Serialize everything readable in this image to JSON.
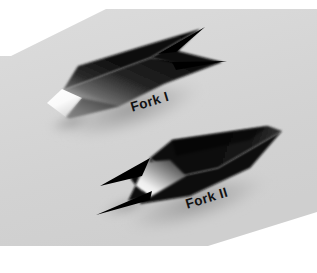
{
  "figure": {
    "kind": "grayscale-photograph",
    "canvas": {
      "width": 317,
      "height": 273
    }
  },
  "labels": {
    "fork_1": "Fork I",
    "fork_2": "Fork II",
    "rotation_deg": -17,
    "color": "#121212"
  },
  "colors": {
    "page_background": "#ffffff",
    "backdrop_light": "#e2e2e2",
    "backdrop_mid": "#d6d6d6",
    "backdrop_dark": "#c9c9c9",
    "object_black": "#050505",
    "object_dark": "#1b1b1b",
    "object_mid": "#4a4a4a",
    "highlight_white": "#ffffff",
    "shadow": "#9c9c9c"
  },
  "backdrop": {
    "name": "rotated-gray-plate",
    "description": "light gray plate filling the frame, chamfered so a white triangle shows at the top-left and bottom-right corners",
    "polygon_points": "11,56 106,9 317,9 317,5 317,212 208,246 0,246 0,273 0,56"
  },
  "objects": [
    {
      "id": "fork-1",
      "label": "Fork I",
      "description": "upper fork, two sharp prongs pointing up-right, bright white end face at the lower-left",
      "prongs": 2,
      "prong_direction": "up-right",
      "highlight_position": "lower-left end face"
    },
    {
      "id": "fork-2",
      "label": "Fork II",
      "description": "lower fork, two sharp prongs pointing down-left, bright white wedge highlight near the middle-left",
      "prongs": 2,
      "prong_direction": "down-left",
      "highlight_position": "middle-left inner face"
    }
  ]
}
